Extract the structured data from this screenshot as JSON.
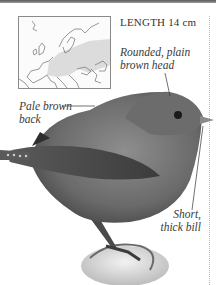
{
  "header": {
    "length_label": "LENGTH 14 cm"
  },
  "range_map": {
    "region": "Europe",
    "range_fill_color": "#d9d9d9",
    "border_color": "#8a8a8a"
  },
  "annotations": {
    "head": [
      "Rounded, plain",
      "brown head"
    ],
    "back": [
      "Pale brown",
      "back"
    ],
    "bill": [
      "Short,",
      "thick bill"
    ]
  },
  "illustration": {
    "subject": "bird-photo",
    "description": "small brown songbird perched on a rock"
  }
}
